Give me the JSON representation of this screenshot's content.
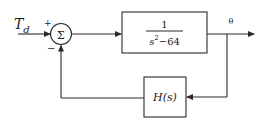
{
  "diagram": {
    "type": "feedback-control-block-diagram",
    "input": {
      "label": "T",
      "subscript": "d"
    },
    "summing_junction": {
      "symbol": "Σ",
      "signs": {
        "top": "+",
        "bottom": "−"
      }
    },
    "forward_block": {
      "numerator": "1",
      "denominator_base": "s",
      "denominator_exp": "2",
      "denominator_rest": "−64"
    },
    "output": {
      "label": "θ"
    },
    "feedback_block": {
      "label": "H(s)"
    }
  },
  "colors": {
    "line": "#2a2a2a",
    "background": "#ffffff"
  }
}
